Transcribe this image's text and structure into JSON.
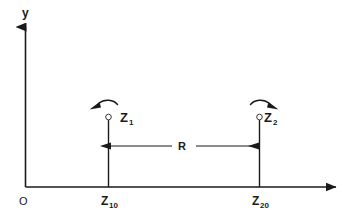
{
  "figure": {
    "background_color": "#ffffff",
    "line_color": "#1a1a1a",
    "axes": {
      "y_axis_label": "y",
      "origin_label": "O",
      "x_axis_label": ""
    },
    "points": [
      {
        "id": "particle-1",
        "label": "Z",
        "subscript": "1",
        "marker": "open-circle",
        "rotation": "counterclockwise",
        "tick_label": "Z",
        "tick_subscript": "10"
      },
      {
        "id": "particle-2",
        "label": "Z",
        "subscript": "2",
        "marker": "open-circle",
        "rotation": "clockwise",
        "tick_label": "Z",
        "tick_subscript": "20"
      }
    ],
    "dimension": {
      "label": "R",
      "style": "double-headed-arrow"
    }
  }
}
